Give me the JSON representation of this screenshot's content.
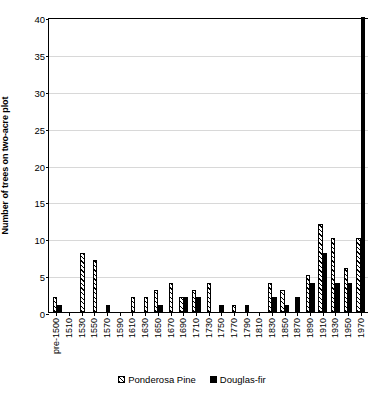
{
  "chart_data": {
    "type": "bar",
    "title": "",
    "xlabel": "",
    "ylabel": "Number of trees on two-acre plot",
    "ylim": [
      0,
      40
    ],
    "yticks": [
      0,
      5,
      10,
      15,
      20,
      25,
      30,
      35,
      40
    ],
    "grid": true,
    "legend_position": "bottom",
    "bar_width_px": 4.4,
    "categories": [
      "pre-1500",
      "1510",
      "1530",
      "1550",
      "1570",
      "1590",
      "1610",
      "1630",
      "1650",
      "1670",
      "1690",
      "1710",
      "1730",
      "1750",
      "1770",
      "1790",
      "1810",
      "1830",
      "1850",
      "1870",
      "1890",
      "1910",
      "1930",
      "1950",
      "1970"
    ],
    "series": [
      {
        "name": "Ponderosa Pine",
        "color": "#ffffff",
        "pattern": "diagonal-hatch",
        "values": [
          2,
          0,
          8,
          7,
          0,
          0,
          2,
          2,
          3,
          4,
          2,
          3,
          4,
          0,
          1,
          0,
          0,
          4,
          3,
          0,
          5,
          12,
          10,
          6,
          10
        ]
      },
      {
        "name": "Douglas-fir",
        "color": "#000000",
        "pattern": "solid",
        "values": [
          1,
          0,
          0,
          0,
          1,
          0,
          0,
          0,
          1,
          0,
          2,
          2,
          0,
          1,
          0,
          1,
          0,
          2,
          1,
          2,
          4,
          8,
          4,
          4,
          40
        ],
        "clipped_note": "1970 bar extends beyond the top of the axis"
      }
    ]
  },
  "legend": {
    "items": [
      {
        "label": "Ponderosa Pine",
        "swatch": "hatched-swatch"
      },
      {
        "label": "Douglas-fir",
        "swatch": "solid-black-swatch"
      }
    ]
  }
}
